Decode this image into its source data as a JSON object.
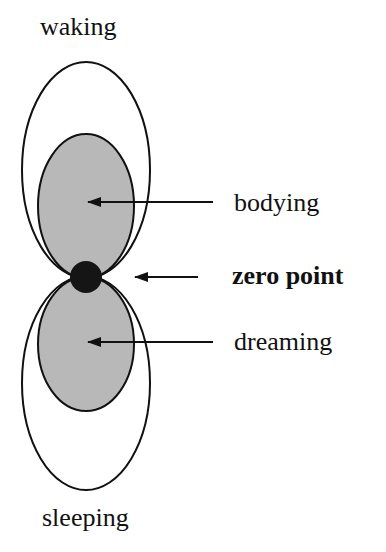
{
  "diagram": {
    "labels": {
      "top": "waking",
      "bottom": "sleeping",
      "upper_inner": "bodying",
      "center": "zero point",
      "lower_inner": "dreaming"
    },
    "colors": {
      "stroke": "#111111",
      "inner_fill": "#b8b8b8",
      "dot_fill": "#151515",
      "background": "#ffffff"
    }
  }
}
